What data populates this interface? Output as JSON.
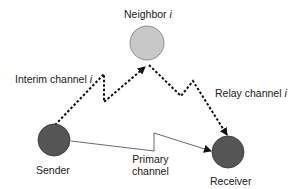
{
  "nodes": {
    "neighbor": {
      "label": "Neighbor",
      "sub": "i",
      "fill": "#c8c8c8"
    },
    "sender": {
      "label": "Sender",
      "fill": "#555555"
    },
    "receiver": {
      "label": "Receiver",
      "fill": "#555555"
    }
  },
  "edges": {
    "interim": {
      "label": "Interim channel",
      "sub": "i",
      "style": "dotted"
    },
    "relay": {
      "label": "Relay channel",
      "sub": "i",
      "style": "dotted"
    },
    "primary": {
      "label_line1": "Primary",
      "label_line2": "channel",
      "style": "solid"
    }
  }
}
